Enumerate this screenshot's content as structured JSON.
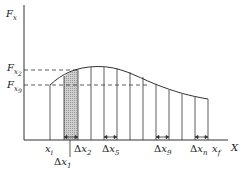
{
  "diagram": {
    "y_axis": {
      "label": "F",
      "sub": "x"
    },
    "x_axis": {
      "label": "X"
    },
    "levels": [
      {
        "label": "F",
        "sub": "x",
        "subsub": "2",
        "y": 70
      },
      {
        "label": "F",
        "sub": "x",
        "subsub": "9",
        "y": 85
      }
    ],
    "x_labels": {
      "xi": {
        "label": "x",
        "sub": "i"
      },
      "dx1": {
        "delta": "Δ",
        "label": "x",
        "sub": "1"
      },
      "dx2": {
        "delta": "Δ",
        "label": "x",
        "sub": "2"
      },
      "dx5": {
        "delta": "Δ",
        "label": "x",
        "sub": "5"
      },
      "dx9": {
        "delta": "Δ",
        "label": "x",
        "sub": "9"
      },
      "dxn": {
        "delta": "Δ",
        "label": "x",
        "sub": "n"
      },
      "xf": {
        "label": "x",
        "sub": "f"
      }
    },
    "strip_positions": [
      50,
      64,
      78,
      91,
      104,
      117,
      130,
      143,
      156,
      169,
      182,
      195,
      208
    ],
    "shaded_strip_index": 1,
    "colors": {
      "line": "#333333",
      "shade": "#bdbdbd"
    }
  }
}
